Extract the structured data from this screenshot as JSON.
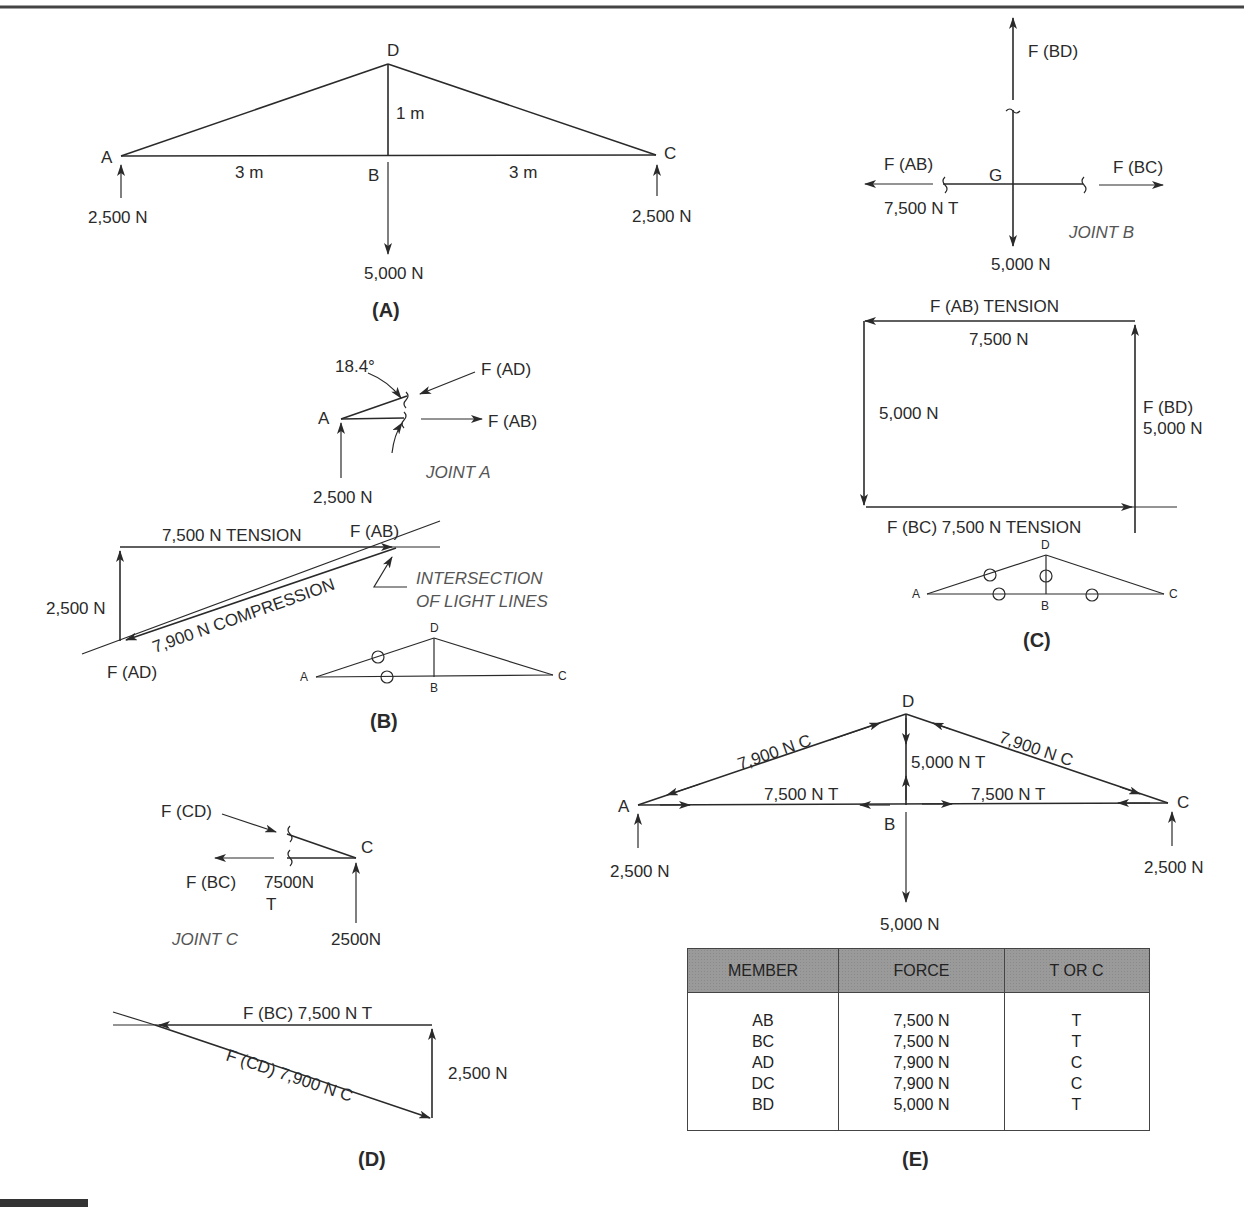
{
  "figure": {
    "panels": {
      "A": {
        "label": "(A)",
        "nodes": {
          "A": "A",
          "B": "B",
          "C": "C",
          "D": "D"
        },
        "dimensions": {
          "height": "1 m",
          "left_span": "3 m",
          "right_span": "3 m"
        },
        "loads": {
          "reaction_A": "2,500 N",
          "reaction_C": "2,500 N",
          "load_B": "5,000 N"
        }
      },
      "B": {
        "label": "(B)",
        "joint_title": "JOINT A",
        "angle": "18.4°",
        "joint_node": "A",
        "force_AD": "F (AD)",
        "force_AB": "F (AB)",
        "reaction": "2,500 N",
        "polygon": {
          "tension_label": "7,500 N  TENSION",
          "fab_label": "F (AB)",
          "compression_label": "7,900 N COMPRESSION",
          "vertical_label": "2,500 N",
          "fad_label": "F (AD)",
          "note_line1": "INTERSECTION",
          "note_line2": "OF LIGHT LINES"
        },
        "mini_truss": {
          "A": "A",
          "B": "B",
          "C": "C",
          "D": "D"
        }
      },
      "C": {
        "label": "(C)",
        "joint_title": "JOINT B",
        "force_BD": "F (BD)",
        "force_AB": "F (AB)",
        "force_AB_value": "7,500 N T",
        "force_BC": "F (BC)",
        "node_G": "G",
        "load": "5,000 N",
        "polygon": {
          "top_label": "F (AB)  TENSION",
          "top_value": "7,500 N",
          "left_value": "5,000 N",
          "right_label": "F (BD)",
          "right_value": "5,000 N",
          "bottom_label": "F (BC)  7,500 N   TENSION"
        },
        "mini_truss": {
          "A": "A",
          "B": "B",
          "C": "C",
          "D": "D"
        }
      },
      "D": {
        "label": "(D)",
        "joint_title": "JOINT C",
        "force_CD": "F (CD)",
        "force_BC": "F (BC)",
        "bc_value_line1": "7500N",
        "bc_value_line2": "T",
        "node_C": "C",
        "reaction": "2500N",
        "polygon": {
          "top_label": "F (BC)  7,500 N T",
          "diag_label": "F (CD) 7,900 N C",
          "vertical_label": "2,500 N"
        }
      },
      "E": {
        "label": "(E)",
        "nodes": {
          "A": "A",
          "B": "B",
          "C": "C",
          "D": "D"
        },
        "member_labels": {
          "AD": "7,900 N C",
          "DC": "7,900 N C",
          "BD": "5,000 N T",
          "AB": "7,500 N T",
          "BC": "7,500 N T"
        },
        "loads": {
          "reaction_A": "2,500 N",
          "reaction_C": "2,500 N",
          "load_B": "5,000 N"
        },
        "table": {
          "headers": [
            "MEMBER",
            "FORCE",
            "T OR C"
          ],
          "rows": [
            {
              "member": "AB",
              "force": "7,500 N",
              "type": "T"
            },
            {
              "member": "BC",
              "force": "7,500 N",
              "type": "T"
            },
            {
              "member": "AD",
              "force": "7,900 N",
              "type": "C"
            },
            {
              "member": "DC",
              "force": "7,900 N",
              "type": "C"
            },
            {
              "member": "BD",
              "force": "5,000 N",
              "type": "T"
            }
          ]
        }
      }
    }
  }
}
